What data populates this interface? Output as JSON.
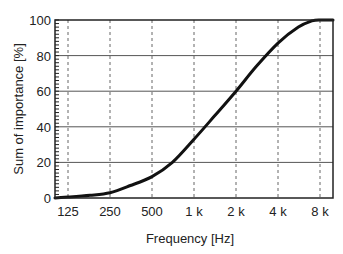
{
  "chart_data": {
    "type": "line",
    "title": "",
    "xlabel": "Frequency   [Hz]",
    "ylabel": "Sum of importance   [%]",
    "x_scale": "log2",
    "x_ticks": [
      "125",
      "250",
      "500",
      "1 k",
      "2 k",
      "4 k",
      "8 k"
    ],
    "x_tick_values": [
      125,
      250,
      500,
      1000,
      2000,
      4000,
      8000
    ],
    "y_ticks": [
      "0",
      "20",
      "40",
      "60",
      "80",
      "100"
    ],
    "y_tick_values": [
      0,
      20,
      40,
      60,
      80,
      100
    ],
    "ylim": [
      0,
      100
    ],
    "xlim": [
      100,
      10000
    ],
    "grid": {
      "horizontal": "solid",
      "vertical": "dashed"
    },
    "legend": null,
    "series": [
      {
        "name": "Sum of importance",
        "x": [
          100,
          125,
          180,
          250,
          350,
          500,
          700,
          1000,
          1400,
          2000,
          2800,
          4000,
          5600,
          7000,
          8000,
          10000
        ],
        "values": [
          0,
          0.5,
          1.5,
          3,
          7,
          12,
          20,
          33,
          46,
          60,
          74,
          87,
          96,
          99.5,
          100,
          100
        ]
      }
    ]
  },
  "colors": {
    "line": "#111111",
    "grid": "#555555",
    "frame": "#222222"
  }
}
